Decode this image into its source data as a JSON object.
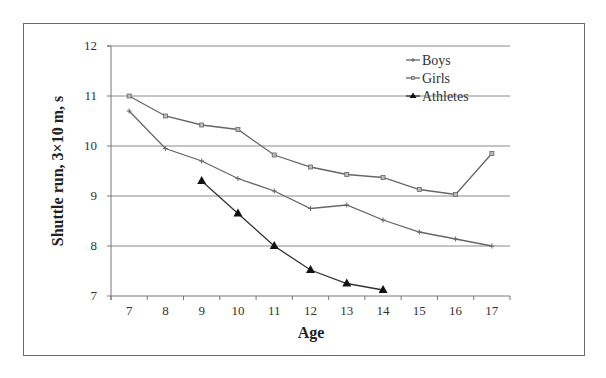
{
  "chart_data": {
    "type": "line",
    "title": "",
    "xlabel": "Age",
    "ylabel": "Shuttle run, 3×10 m, s",
    "categories": [
      "7",
      "8",
      "9",
      "10",
      "11",
      "12",
      "13",
      "14",
      "15",
      "16",
      "17"
    ],
    "ylim": [
      7,
      12
    ],
    "yticks": [
      "7",
      "8",
      "9",
      "10",
      "11",
      "12"
    ],
    "grid": true,
    "legend_position": "top-right",
    "series": [
      {
        "name": "Boys",
        "marker": "plus",
        "color": "#666666",
        "values": [
          10.7,
          9.95,
          9.7,
          9.35,
          9.1,
          8.75,
          8.82,
          8.52,
          8.28,
          8.14,
          8.0
        ]
      },
      {
        "name": "Girls",
        "marker": "square",
        "color": "#666666",
        "values": [
          11.0,
          10.6,
          10.42,
          10.33,
          9.82,
          9.58,
          9.43,
          9.37,
          9.13,
          9.03,
          9.85
        ]
      },
      {
        "name": "Athletes",
        "marker": "triangle",
        "color": "#333333",
        "values": [
          null,
          null,
          9.3,
          8.65,
          8.0,
          7.52,
          7.25,
          7.12,
          null,
          null,
          null
        ]
      }
    ]
  }
}
